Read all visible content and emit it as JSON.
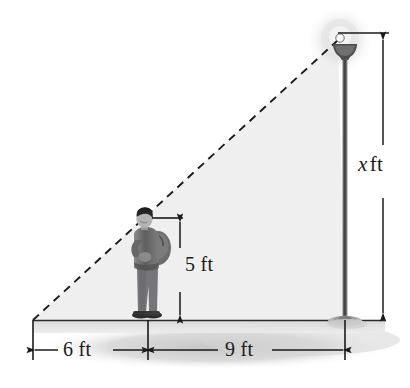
{
  "figure": {
    "type": "geometry-illustration",
    "background_color": "#ffffff"
  },
  "labels": {
    "height_unknown": {
      "variable": "x",
      "unit": "ft",
      "full": "x ft"
    },
    "person_height": "5 ft",
    "shadow_length": "6 ft",
    "person_to_pole": "9 ft"
  },
  "colors": {
    "ink": "#1a1a1a",
    "triangle_fill": "#f2f2f2",
    "ground_shadow": "#c9c9c9",
    "pole": "#6e6e6e",
    "pole_dark": "#4a4a4a",
    "person_clothes": "#6b6b6b",
    "person_hair": "#262626",
    "halo": "#d8d8d8"
  },
  "geometry": {
    "ground_y": 320,
    "apex_x": 33,
    "pole_x": 345,
    "lamp_top_y": 40,
    "person_x": 148,
    "person_top_y": 218,
    "dim_x_line_x": 383,
    "dim_5_line_x": 180,
    "dim_horizontal_y": 350
  },
  "parts": {
    "lamp_post": "lamp-post",
    "lamp_head": "lamp-head",
    "lamp_glow": "lamp-glow",
    "pole_base": "pole-base",
    "person": "person-figure",
    "backpack": "backpack",
    "ground_line": "ground-line",
    "hypotenuse": "dashed-light-ray",
    "triangle": "shaded-triangle"
  }
}
